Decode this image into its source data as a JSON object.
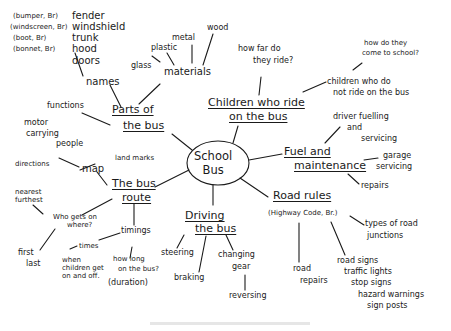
{
  "center": {
    "line1": "School",
    "line2": "Bus"
  },
  "branches": {
    "parts": {
      "title1": "Parts of",
      "title2": "the bus",
      "names": "names",
      "name_items": [
        "fender",
        "windshield",
        "trunk",
        "hood",
        "doors"
      ],
      "british_terms": [
        "(bumper, Br)",
        "(windscreen, Br)",
        "(boot, Br)",
        "(bonnet, Br)"
      ],
      "materials": "materials",
      "material_items": [
        "glass",
        "plastic",
        "metal",
        "wood"
      ],
      "functions": "functions",
      "function_items": [
        "motor",
        "carrying",
        "people"
      ]
    },
    "children": {
      "title1": "Children who ride",
      "title2": "on the bus",
      "how_far1": "how far do",
      "how_far2": "they ride?",
      "not_ride1": "children who do",
      "not_ride2": "not ride on the bus",
      "how_come1": "how do they",
      "how_come2": "come to school?"
    },
    "fuel": {
      "title1": "Fuel and",
      "title2": "maintenance",
      "driver1": "driver fuelling",
      "driver2": "and",
      "driver3": "servicing",
      "garage1": "garage",
      "garage2": "servicing",
      "repairs": "repairs"
    },
    "road": {
      "title": "Road rules",
      "subtitle": "(Highway Code, Br.)",
      "junctions1": "types of road",
      "junctions2": "junctions",
      "road_repairs1": "road",
      "road_repairs2": "repairs",
      "signs": [
        "road signs",
        "traffic lights",
        "stop signs",
        "hazard warnings",
        "sign posts"
      ]
    },
    "driving": {
      "title1": "Driving",
      "title2": "the bus",
      "steering": "steering",
      "braking": "braking",
      "gear1": "changing",
      "gear2": "gear",
      "reversing": "reversing"
    },
    "route": {
      "title1": "The bus",
      "title2": "route",
      "map": "map",
      "landmarks": "land marks",
      "directions": "directions",
      "who1": "Who gets on",
      "who2": "where?",
      "nearest": "nearest",
      "furthest": "furthest",
      "first": "first",
      "last": "last",
      "timings": "timings",
      "times": "times",
      "when1": "when",
      "when2": "children get",
      "when3": "on and off.",
      "howlong1": "how long",
      "howlong2": "on the bus?",
      "duration": "(duration)"
    }
  },
  "style": {
    "ink": "#1a1a1a",
    "background": "#ffffff"
  }
}
